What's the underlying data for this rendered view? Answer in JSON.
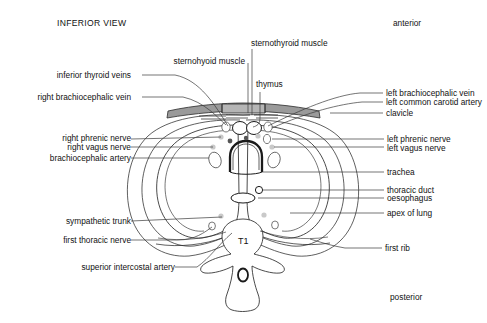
{
  "figure": {
    "title": "INFERIOR VIEW",
    "orientation": {
      "anterior": "anterior",
      "posterior": "posterior"
    },
    "vertebra_label": "T1",
    "colors": {
      "stroke": "#1a1a1a",
      "bone_fill": "#9a9a9a",
      "nerve_fill": "#c9c9c9",
      "pleura_fill": "#e8e8e8",
      "background": "#ffffff",
      "text": "#111111"
    },
    "labels_left": [
      {
        "id": "inferior-thyroid-veins",
        "text": "inferior thyroid veins"
      },
      {
        "id": "right-brachiocephalic-vein",
        "text": "right brachiocephalic vein"
      },
      {
        "id": "right-phrenic-nerve",
        "text": "right phrenic nerve"
      },
      {
        "id": "right-vagus-nerve",
        "text": "right vagus nerve"
      },
      {
        "id": "brachiocephalic-artery",
        "text": "brachiocephalic artery"
      },
      {
        "id": "sympathetic-trunk",
        "text": "sympathetic trunk"
      },
      {
        "id": "first-thoracic-nerve",
        "text": "first thoracic nerve"
      },
      {
        "id": "superior-intercostal-artery",
        "text": "superior intercostal artery"
      }
    ],
    "labels_top": [
      {
        "id": "sternothyroid-muscle",
        "text": "sternothyroid muscle"
      },
      {
        "id": "sternohyoid-muscle",
        "text": "sternohyoid muscle"
      },
      {
        "id": "thymus",
        "text": "thymus"
      }
    ],
    "labels_right": [
      {
        "id": "left-brachiocephalic-vein",
        "text": "left brachiocephalic vein"
      },
      {
        "id": "left-common-carotid-artery",
        "text": "left common carotid artery"
      },
      {
        "id": "clavicle",
        "text": "clavicle"
      },
      {
        "id": "left-phrenic-nerve",
        "text": "left phrenic nerve"
      },
      {
        "id": "left-vagus-nerve",
        "text": "left vagus nerve"
      },
      {
        "id": "trachea",
        "text": "trachea"
      },
      {
        "id": "thoracic-duct",
        "text": "thoracic duct"
      },
      {
        "id": "oesophagus",
        "text": "oesophagus"
      },
      {
        "id": "apex-of-lung",
        "text": "apex of lung"
      },
      {
        "id": "first-rib",
        "text": "first rib"
      }
    ]
  }
}
